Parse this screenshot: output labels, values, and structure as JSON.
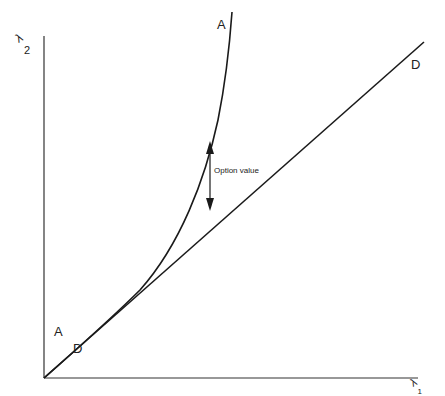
{
  "axes": {
    "y_label_symbol": "λ",
    "y_label_sub": "2",
    "x_label_symbol": "λ",
    "x_label_sub": "1"
  },
  "curves": {
    "A_top_label": "A",
    "A_bottom_label": "A",
    "D_top_label": "D",
    "D_bottom_label": "D"
  },
  "annotation": {
    "text": "Option value"
  },
  "colors": {
    "line": "#1a1a1a",
    "axis": "#333333"
  }
}
